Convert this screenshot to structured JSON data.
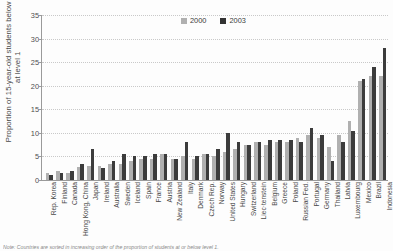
{
  "chart_data": {
    "type": "bar",
    "title": "",
    "xlabel": "",
    "ylabel": "Proportion of 15-year-old students below or at level 1",
    "ylim": [
      0,
      35
    ],
    "yticks": [
      0,
      5,
      10,
      15,
      20,
      25,
      30,
      35
    ],
    "grid": true,
    "legend_position": "top-center",
    "categories": [
      "Rep. Korea",
      "Finland",
      "Canada",
      "Hong Kong, China",
      "Japan",
      "Ireland",
      "Australia",
      "Sweden",
      "Iceland",
      "Spain",
      "France",
      "Austria",
      "New Zealand",
      "Italy",
      "Denmark",
      "Czech Rep.",
      "Norway",
      "United States",
      "Hungary",
      "Switzerland",
      "Liec·tenstein",
      "Belgium",
      "Greece",
      "Poland",
      "Russian Fed.",
      "Portugal",
      "Germany",
      "Thailand",
      "Latvia",
      "Luxembourg",
      "Mexico",
      "Brazil",
      "Indonesia"
    ],
    "series": [
      {
        "name": "2000",
        "color": "#b0b0b0",
        "values": [
          1.5,
          2.0,
          1.5,
          2.8,
          3.0,
          3.0,
          3.5,
          3.5,
          4.0,
          4.5,
          4.5,
          5.5,
          4.5,
          5.0,
          4.5,
          5.5,
          5.0,
          6.0,
          6.5,
          7.5,
          8.0,
          7.5,
          8.0,
          8.0,
          9.0,
          9.5,
          9.0,
          7.0,
          9.5,
          12.5,
          21.0,
          22.0,
          22.0
        ]
      },
      {
        "name": "2003",
        "color": "#3c3c3c",
        "values": [
          1.0,
          1.5,
          2.0,
          3.5,
          6.5,
          2.5,
          4.0,
          5.5,
          5.0,
          5.0,
          5.5,
          5.5,
          4.5,
          8.0,
          5.0,
          5.5,
          6.5,
          10.0,
          8.0,
          7.5,
          8.0,
          8.5,
          8.5,
          8.5,
          8.0,
          11.0,
          9.5,
          4.0,
          8.0,
          10.5,
          21.5,
          24.0,
          28.0
        ]
      }
    ],
    "legend": [
      "2000",
      "2003"
    ],
    "note": "Note: Countries are sorted in increasing order of the proportion of students at or below level 1."
  }
}
